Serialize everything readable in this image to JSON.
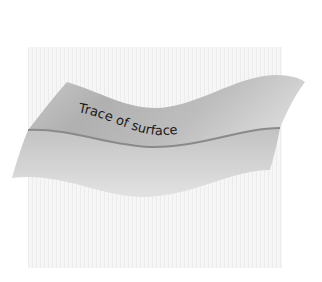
{
  "diagram": {
    "label": "Trace of surface",
    "colors": {
      "background_panel": "#f3f3f3",
      "surface_light": "#e4e4e4",
      "surface_dark": "#a9a9a9",
      "trace_line": "#8a8a8a",
      "text": "#1a1a1a"
    }
  }
}
